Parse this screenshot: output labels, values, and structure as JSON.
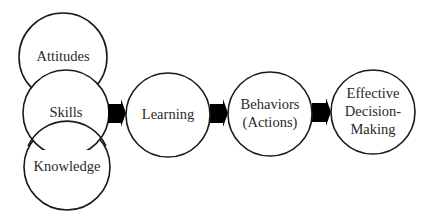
{
  "diagram": {
    "type": "flow",
    "colors": {
      "stroke": "#1a1a1a",
      "fill": "#ffffff",
      "arrow": "#000000",
      "text": "#2a2a2a"
    },
    "inputs": [
      {
        "id": "attitudes",
        "label": "Attitudes"
      },
      {
        "id": "skills",
        "label": "Skills"
      },
      {
        "id": "knowledge",
        "label": "Knowledge"
      }
    ],
    "nodes": [
      {
        "id": "learning",
        "lines": [
          "Learning"
        ]
      },
      {
        "id": "behaviors",
        "lines": [
          "Behaviors",
          "(Actions)"
        ]
      },
      {
        "id": "effective",
        "lines": [
          "Effective",
          "Decision-",
          "Making"
        ]
      }
    ],
    "edges": [
      {
        "from": "skills",
        "to": "learning"
      },
      {
        "from": "learning",
        "to": "behaviors"
      },
      {
        "from": "behaviors",
        "to": "effective"
      }
    ]
  }
}
